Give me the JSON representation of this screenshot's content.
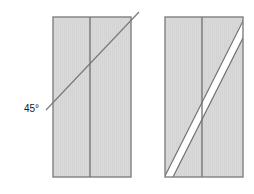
{
  "diagram": {
    "background_color": "#ffffff",
    "annotations": [
      {
        "id": "angle",
        "text": "45°",
        "x": 24,
        "y": 112,
        "color": "#1a1a1a"
      }
    ],
    "figures": [
      {
        "id": "before",
        "name": "panel-with-cut-line",
        "panel": {
          "x": 53,
          "y": 17,
          "width": 78,
          "height": 160,
          "fill": "#d9d9d9",
          "stroke": "#808080"
        },
        "seam": {
          "x": 90,
          "y_top": 17,
          "y_bottom": 177,
          "stroke": "#6e6e6e"
        },
        "cut_line": {
          "x1": 46,
          "y1": 110,
          "x2": 139,
          "y2": 12,
          "stroke": "#7a7a7a",
          "angle": 45
        }
      },
      {
        "id": "after",
        "name": "panel-cut-apart",
        "panel": {
          "x": 165,
          "y": 17,
          "width": 78,
          "height": 160,
          "fill": "#d9d9d9",
          "stroke": "#808080"
        },
        "seam": {
          "x": 202,
          "y_top": 17,
          "y_bottom": 177,
          "stroke": "#6e6e6e"
        },
        "cut_gap": {
          "x1": 165,
          "y1": 177,
          "x2": 243,
          "y2": 20,
          "gap_width": 4,
          "fill": "#ffffff",
          "stroke": "#707070"
        }
      }
    ]
  }
}
